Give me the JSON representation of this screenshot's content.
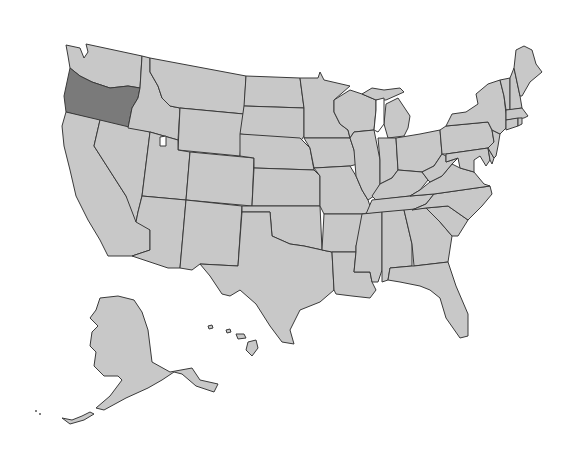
{
  "map": {
    "title": "United States map",
    "highlighted_state": "Oregon",
    "colors": {
      "default_fill": "#c8c8c8",
      "highlight_fill": "#7a7a7a",
      "border": "#3a3a3a",
      "background": "#ffffff"
    },
    "states": [
      {
        "name": "Washington",
        "highlighted": false
      },
      {
        "name": "Oregon",
        "highlighted": true
      },
      {
        "name": "California",
        "highlighted": false
      },
      {
        "name": "Idaho",
        "highlighted": false
      },
      {
        "name": "Nevada",
        "highlighted": false
      },
      {
        "name": "Montana",
        "highlighted": false
      },
      {
        "name": "Wyoming",
        "highlighted": false
      },
      {
        "name": "Utah",
        "highlighted": false
      },
      {
        "name": "Arizona",
        "highlighted": false
      },
      {
        "name": "Colorado",
        "highlighted": false
      },
      {
        "name": "New Mexico",
        "highlighted": false
      },
      {
        "name": "North Dakota",
        "highlighted": false
      },
      {
        "name": "South Dakota",
        "highlighted": false
      },
      {
        "name": "Nebraska",
        "highlighted": false
      },
      {
        "name": "Kansas",
        "highlighted": false
      },
      {
        "name": "Oklahoma",
        "highlighted": false
      },
      {
        "name": "Texas",
        "highlighted": false
      },
      {
        "name": "Minnesota",
        "highlighted": false
      },
      {
        "name": "Iowa",
        "highlighted": false
      },
      {
        "name": "Missouri",
        "highlighted": false
      },
      {
        "name": "Arkansas",
        "highlighted": false
      },
      {
        "name": "Louisiana",
        "highlighted": false
      },
      {
        "name": "Wisconsin",
        "highlighted": false
      },
      {
        "name": "Illinois",
        "highlighted": false
      },
      {
        "name": "Michigan",
        "highlighted": false
      },
      {
        "name": "Indiana",
        "highlighted": false
      },
      {
        "name": "Ohio",
        "highlighted": false
      },
      {
        "name": "Kentucky",
        "highlighted": false
      },
      {
        "name": "Tennessee",
        "highlighted": false
      },
      {
        "name": "Mississippi",
        "highlighted": false
      },
      {
        "name": "Alabama",
        "highlighted": false
      },
      {
        "name": "Georgia",
        "highlighted": false
      },
      {
        "name": "Florida",
        "highlighted": false
      },
      {
        "name": "South Carolina",
        "highlighted": false
      },
      {
        "name": "North Carolina",
        "highlighted": false
      },
      {
        "name": "Virginia",
        "highlighted": false
      },
      {
        "name": "West Virginia",
        "highlighted": false
      },
      {
        "name": "Pennsylvania",
        "highlighted": false
      },
      {
        "name": "New York",
        "highlighted": false
      },
      {
        "name": "Vermont",
        "highlighted": false
      },
      {
        "name": "New Hampshire",
        "highlighted": false
      },
      {
        "name": "Maine",
        "highlighted": false
      },
      {
        "name": "Massachusetts",
        "highlighted": false
      },
      {
        "name": "Connecticut",
        "highlighted": false
      },
      {
        "name": "Rhode Island",
        "highlighted": false
      },
      {
        "name": "New Jersey",
        "highlighted": false
      },
      {
        "name": "Delaware",
        "highlighted": false
      },
      {
        "name": "Maryland",
        "highlighted": false
      },
      {
        "name": "Alaska",
        "highlighted": false
      },
      {
        "name": "Hawaii",
        "highlighted": false
      }
    ]
  }
}
